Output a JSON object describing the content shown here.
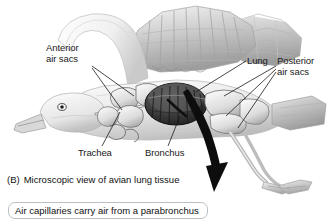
{
  "figure": {
    "species_illustration": "gull-like bird, lateral cutaway view",
    "style": "grayscale pencil/airbrush anatomical illustration",
    "background_color": "#ffffff",
    "ink_color": "#1a1a1a",
    "arrow_color": "#0d0d0d"
  },
  "labels": {
    "anterior_air_sacs": "Anterior\nair sacs",
    "anterior_air_sacs_line1": "Anterior",
    "anterior_air_sacs_line2": "air sacs",
    "lung": "Lung",
    "posterior_air_sacs_line1": "Posterior",
    "posterior_air_sacs_line2": "air sacs",
    "trachea": "Trachea",
    "bronchus": "Bronchus"
  },
  "caption": {
    "tag": "(B)",
    "text": "Microscopic view of avian lung tissue"
  },
  "callout": {
    "text": "Air capillaries carry air from a parabronchus",
    "border_color": "#b9bfc4"
  },
  "arrow": {
    "name": "down-arrow",
    "direction": "down",
    "description": "thick curved black arrow pointing downward from lung to microscopic view section"
  },
  "leader_lines": {
    "count": 7,
    "color": "#1a1a1a"
  }
}
